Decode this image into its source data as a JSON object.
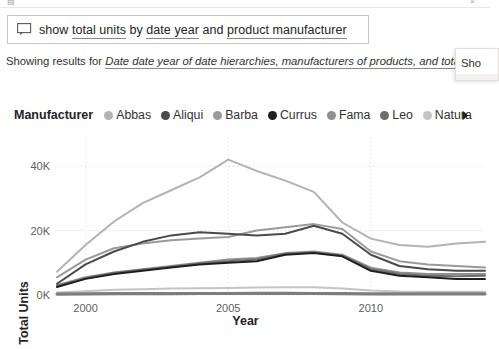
{
  "top_strip": {
    "left_glyph": "▤",
    "right_glyph": "×"
  },
  "qna": {
    "icon_name": "qna-speech-bubble-icon",
    "question_segments": [
      {
        "text": "show ",
        "highlighted": false
      },
      {
        "text": "total units",
        "highlighted": true
      },
      {
        "text": " by ",
        "highlighted": false
      },
      {
        "text": "date year",
        "highlighted": true
      },
      {
        "text": " and ",
        "highlighted": false
      },
      {
        "text": "product manufacturer",
        "highlighted": true
      }
    ],
    "question_plain": "show total units by date year and product manufacturer",
    "placeholder": "Ask a question about your data"
  },
  "results": {
    "prefix": "Showing results for ",
    "link_text": "Date date year of date hierarchies, manufacturers of products, and tota"
  },
  "side_popup": {
    "text": "Sho"
  },
  "legend": {
    "title": "Manufacturer",
    "next_icon": "chevron-right-icon",
    "items": [
      {
        "label": "Abbas",
        "color": "#b3b3b3"
      },
      {
        "label": "Aliqui",
        "color": "#4a4a4a"
      },
      {
        "label": "Barba",
        "color": "#9a9a9a"
      },
      {
        "label": "Currus",
        "color": "#1f1f1f"
      },
      {
        "label": "Fama",
        "color": "#8f8f8f"
      },
      {
        "label": "Leo",
        "color": "#6e6e6e"
      },
      {
        "label": "Natura",
        "color": "#c4c4c4"
      }
    ]
  },
  "chart_data": {
    "type": "line",
    "title": "",
    "xlabel": "Year",
    "ylabel": "Total Units",
    "xlim": [
      1999,
      2014
    ],
    "ylim": [
      0,
      45000
    ],
    "ytick_values": [
      0,
      20000,
      40000
    ],
    "ytick_labels": [
      "0K",
      "20K",
      "40K"
    ],
    "xtick_values": [
      2000,
      2005,
      2010
    ],
    "xtick_labels": [
      "2000",
      "2005",
      "2010"
    ],
    "grid": "dotted",
    "legend_position": "top",
    "x": [
      1999,
      2000,
      2001,
      2002,
      2003,
      2004,
      2005,
      2006,
      2007,
      2008,
      2009,
      2010,
      2011,
      2012,
      2013,
      2014
    ],
    "series": [
      {
        "name": "Abbas",
        "color": "#b3b3b3",
        "values": [
          7200,
          15500,
          22800,
          28500,
          32500,
          36500,
          42000,
          38500,
          35500,
          32000,
          22500,
          17500,
          15500,
          15000,
          16000,
          16500
        ]
      },
      {
        "name": "Aliqui",
        "color": "#4a4a4a",
        "values": [
          3500,
          9500,
          13500,
          16500,
          18500,
          19500,
          19000,
          18500,
          19000,
          21500,
          19000,
          12500,
          9000,
          8000,
          7500,
          7500
        ]
      },
      {
        "name": "Barba",
        "color": "#9a9a9a",
        "values": [
          5500,
          11000,
          14500,
          16000,
          17000,
          17500,
          18000,
          20000,
          21000,
          22000,
          20500,
          13500,
          10500,
          9500,
          9000,
          8500
        ]
      },
      {
        "name": "Currus",
        "color": "#1f1f1f",
        "values": [
          2500,
          5000,
          6500,
          7500,
          8500,
          9500,
          10000,
          10500,
          12500,
          13000,
          12000,
          7500,
          6000,
          5500,
          5000,
          5000
        ]
      },
      {
        "name": "Fama",
        "color": "#8f8f8f",
        "values": [
          3000,
          5500,
          7000,
          8000,
          9000,
          10000,
          11000,
          11500,
          13000,
          13500,
          12500,
          8500,
          7000,
          6500,
          6500,
          6500
        ]
      },
      {
        "name": "Leo",
        "color": "#6e6e6e",
        "values": [
          2800,
          5200,
          6800,
          7800,
          8800,
          9800,
          10500,
          11000,
          12800,
          13200,
          12200,
          8000,
          6500,
          6000,
          5800,
          6000
        ]
      },
      {
        "name": "Natura",
        "color": "#c4c4c4",
        "values": [
          800,
          1200,
          1600,
          1800,
          2000,
          2100,
          2200,
          2300,
          2400,
          2400,
          2000,
          1400,
          1100,
          1000,
          1000,
          1000
        ]
      },
      {
        "name": "baseline",
        "color": "#7d7d7d",
        "values": [
          300,
          350,
          400,
          420,
          450,
          460,
          470,
          480,
          480,
          470,
          420,
          360,
          330,
          320,
          320,
          320
        ]
      }
    ]
  }
}
